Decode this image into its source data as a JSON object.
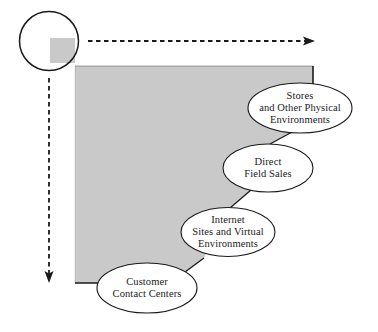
{
  "figure": {
    "type": "channel-cascade-diagram",
    "background_color": "#ffffff",
    "block_fill_color": "#c9c9c9",
    "outline_color": "#1a1a1a",
    "ellipse_fill_color": "#ffffff",
    "text_color": "#1a1a1a"
  },
  "origin_marker": {
    "name": "origin-circle",
    "label": "",
    "center_x": 49,
    "center_y": 41,
    "radius": 29.5
  },
  "axes": [
    {
      "name": "horizontal-axis-arrow",
      "label": "",
      "direction": "right",
      "style": "dashed",
      "from_x": 88,
      "from_y": 41,
      "to_x": 315,
      "to_y": 41
    },
    {
      "name": "vertical-axis-arrow",
      "label": "",
      "direction": "down",
      "style": "dashed",
      "from_x": 49,
      "from_y": 78,
      "to_x": 49,
      "to_y": 283
    }
  ],
  "staircase_block": {
    "name": "cascade-block",
    "fill": "#c9c9c9",
    "corner_square_x": 50,
    "corner_square_y": 38,
    "left_x": 75,
    "top_y": 66,
    "right_x": 313,
    "bottom_y": 283
  },
  "nodes": [
    {
      "id": "stores",
      "name": "node-stores-and-other-physical-environments",
      "lines": [
        "Stores",
        "and Other Physical",
        "Environments"
      ],
      "cx": 300,
      "cy": 108,
      "rx": 52,
      "ry": 25
    },
    {
      "id": "direct-field-sales",
      "name": "node-direct-field-sales",
      "lines": [
        "Direct",
        "Field Sales"
      ],
      "cx": 268,
      "cy": 168,
      "rx": 45,
      "ry": 24
    },
    {
      "id": "internet-sites",
      "name": "node-internet-sites-and-virtual-environments",
      "lines": [
        "Internet",
        "Sites and Virtual",
        "Environments"
      ],
      "cx": 228,
      "cy": 232,
      "rx": 47,
      "ry": 24.5
    },
    {
      "id": "customer-contact-centers",
      "name": "node-customer-contact-centers",
      "lines": [
        "Customer",
        "Contact Centers"
      ],
      "cx": 147,
      "cy": 288,
      "rx": 50,
      "ry": 25
    }
  ]
}
